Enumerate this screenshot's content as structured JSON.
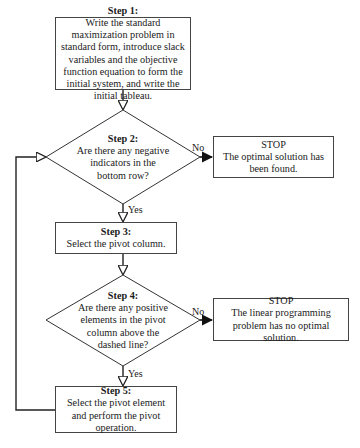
{
  "header_fragment": "Simplex Method",
  "steps": {
    "step1": {
      "title": "Step 1:",
      "text": "Write the standard maximization problem in standard form, introduce slack variables and the objective function equation to form the initial system, and write the initial tableau."
    },
    "step2": {
      "title": "Step 2:",
      "text": "Are there any negative indicators in the bottom row?"
    },
    "step3": {
      "title": "Step 3:",
      "text": "Select the pivot column."
    },
    "step4": {
      "title": "Step 4:",
      "text": "Are there any positive elements in the pivot column above the dashed line?"
    },
    "step5": {
      "title": "Step 5:",
      "text": "Select the pivot element and perform the pivot operation."
    }
  },
  "stops": {
    "stop1": {
      "title": "STOP",
      "text": "The optimal solution has been found."
    },
    "stop2": {
      "title": "STOP",
      "text": "The linear programming problem has no optimal solution."
    }
  },
  "labels": {
    "no1": "No",
    "yes1": "Yes",
    "no2": "No",
    "yes2": "Yes"
  }
}
